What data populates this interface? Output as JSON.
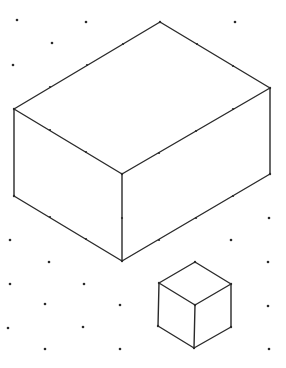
{
  "diagram": {
    "type": "isometric-dot-grid",
    "background": "#ffffff",
    "stroke_color": "#2a2a2a",
    "grid_dots": [
      [
        17,
        20
      ],
      [
        86,
        22
      ],
      [
        235,
        22
      ],
      [
        52,
        43
      ],
      [
        13,
        65
      ],
      [
        160,
        66
      ],
      [
        123,
        87
      ],
      [
        197,
        88
      ],
      [
        85,
        108
      ],
      [
        160,
        109
      ],
      [
        123,
        131
      ],
      [
        235,
        153
      ],
      [
        48,
        174
      ],
      [
        197,
        175
      ],
      [
        85,
        196
      ],
      [
        159,
        198
      ],
      [
        269,
        218
      ],
      [
        10,
        240
      ],
      [
        231,
        240
      ],
      [
        49,
        262
      ],
      [
        268,
        262
      ],
      [
        10,
        284
      ],
      [
        84,
        284
      ],
      [
        45,
        304
      ],
      [
        120,
        305
      ],
      [
        268,
        306
      ],
      [
        8,
        328
      ],
      [
        83,
        327
      ],
      [
        45,
        349
      ],
      [
        120,
        349
      ],
      [
        269,
        349
      ]
    ],
    "edge_dots": [
      [
        50,
        87
      ],
      [
        87,
        65
      ],
      [
        123,
        44
      ],
      [
        197,
        44
      ],
      [
        233,
        66
      ],
      [
        50,
        130
      ],
      [
        86,
        152
      ],
      [
        159,
        153
      ],
      [
        196,
        131
      ],
      [
        233,
        109
      ],
      [
        122,
        218
      ],
      [
        159,
        240
      ],
      [
        196,
        218
      ],
      [
        233,
        196
      ],
      [
        50,
        217
      ],
      [
        86,
        239
      ]
    ],
    "shapes": [
      {
        "name": "large-rectangular-prism",
        "vertices": {
          "top": [
            160,
            22
          ],
          "left_top": [
            14,
            109
          ],
          "front_top": [
            122,
            174
          ],
          "right_top": [
            270,
            88
          ],
          "left_bottom": [
            14,
            196
          ],
          "front_bottom": [
            122,
            261
          ],
          "right_bottom": [
            270,
            174
          ]
        }
      },
      {
        "name": "small-cube",
        "vertices": {
          "top": [
            195,
            262
          ],
          "left_top": [
            159,
            283
          ],
          "front_top": [
            195,
            305
          ],
          "right_top": [
            231,
            284
          ],
          "left_bottom": [
            158,
            326
          ],
          "front_bottom": [
            194,
            348
          ],
          "right_bottom": [
            231,
            327
          ]
        }
      }
    ]
  }
}
